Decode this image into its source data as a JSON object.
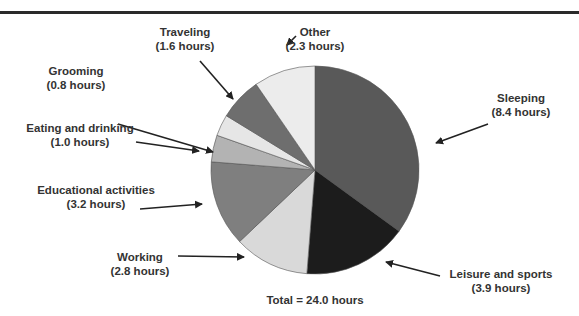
{
  "chart_data": {
    "type": "pie",
    "title": "",
    "unit": "hours",
    "total_label": "Total = 24.0 hours",
    "total": 24.0,
    "start_angle_deg": 0,
    "direction": "clockwise",
    "slices": [
      {
        "label": "Sleeping",
        "value": 8.4,
        "value_label": "(8.4 hours)",
        "color": "#595959"
      },
      {
        "label": "Leisure and sports",
        "value": 3.9,
        "value_label": "(3.9 hours)",
        "color": "#1c1c1c"
      },
      {
        "label": "Working",
        "value": 2.8,
        "value_label": "(2.8 hours)",
        "color": "#d9d9d9"
      },
      {
        "label": "Educational activities",
        "value": 3.2,
        "value_label": "(3.2 hours)",
        "color": "#7f7f7f"
      },
      {
        "label": "Eating and drinking",
        "value": 1.0,
        "value_label": "(1.0 hours)",
        "color": "#b3b3b3"
      },
      {
        "label": "Grooming",
        "value": 0.8,
        "value_label": "(0.8 hours)",
        "color": "#e6e6e6"
      },
      {
        "label": "Traveling",
        "value": 1.6,
        "value_label": "(1.6 hours)",
        "color": "#6e6e6e"
      },
      {
        "label": "Other",
        "value": 2.3,
        "value_label": "(2.3 hours)",
        "color": "#ececec"
      }
    ],
    "legend": "none (callout labels with arrows)"
  },
  "labels": {
    "sleeping": {
      "name": "Sleeping",
      "hours": "(8.4 hours)"
    },
    "leisure": {
      "name": "Leisure and sports",
      "hours": "(3.9 hours)"
    },
    "working": {
      "name": "Working",
      "hours": "(2.8 hours)"
    },
    "educational": {
      "name": "Educational activities",
      "hours": "(3.2 hours)"
    },
    "eating": {
      "name": "Eating and drinking",
      "hours": "(1.0 hours)"
    },
    "grooming": {
      "name": "Grooming",
      "hours": "(0.8 hours)"
    },
    "traveling": {
      "name": "Traveling",
      "hours": "(1.6 hours)"
    },
    "other": {
      "name": "Other",
      "hours": "(2.3 hours)"
    }
  },
  "total_text": "Total = 24.0 hours"
}
